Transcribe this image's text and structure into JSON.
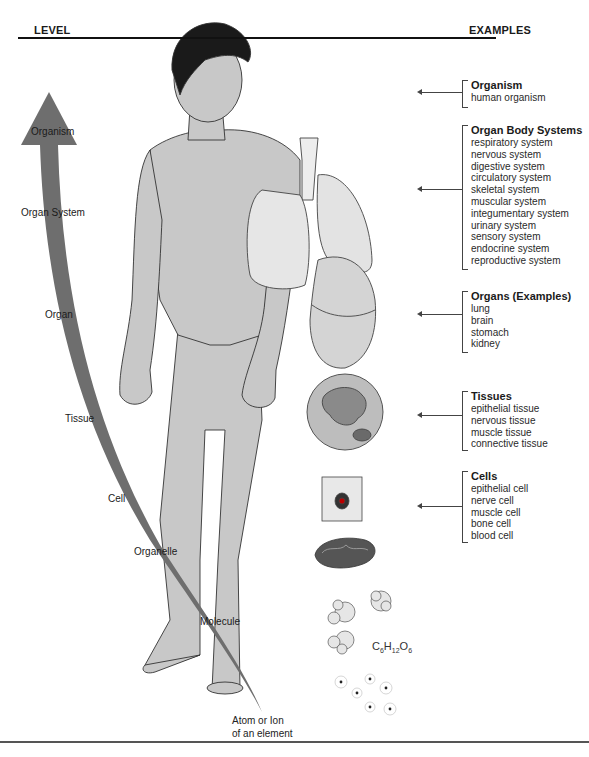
{
  "header": {
    "level_label": "LEVEL",
    "examples_label": "EXAMPLES"
  },
  "levels": [
    {
      "label": "Organism"
    },
    {
      "label": "Organ System"
    },
    {
      "label": "Organ"
    },
    {
      "label": "Tissue"
    },
    {
      "label": "Cell"
    },
    {
      "label": "Organelle"
    },
    {
      "label": "Molecule"
    },
    {
      "label": "Atom or Ion",
      "label2": "of an element"
    }
  ],
  "examples": [
    {
      "title": "Organism",
      "items": [
        "human organism"
      ]
    },
    {
      "title": "Organ Body Systems",
      "items": [
        "respiratory system",
        "nervous system",
        "digestive system",
        "circulatory system",
        "skeletal system",
        "muscular system",
        "integumentary system",
        "urinary system",
        "sensory system",
        "endocrine system",
        "reproductive system"
      ]
    },
    {
      "title": "Organs (Examples)",
      "items": [
        "lung",
        "brain",
        "stomach",
        "kidney"
      ]
    },
    {
      "title": "Tissues",
      "items": [
        "epithelial tissue",
        "nervous tissue",
        "muscle tissue",
        "connective tissue"
      ]
    },
    {
      "title": "Cells",
      "items": [
        "epithelial cell",
        "nerve cell",
        "muscle cell",
        "bone cell",
        "blood cell"
      ]
    }
  ],
  "molecule_formula": {
    "C": "C",
    "c_sub": "6",
    "H": "H",
    "h_sub": "12",
    "O": "O",
    "o_sub": "6"
  },
  "colors": {
    "arrow": "#6e6e6e",
    "skin": "#c8c8c8",
    "hair": "#1a1a1a",
    "organ": "#e2e2e2",
    "line": "#444444"
  }
}
